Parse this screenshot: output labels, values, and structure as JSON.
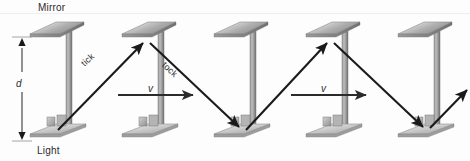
{
  "figure": {
    "title_alt": "Light clock moving at velocity v",
    "background_color": "#fdfdfd",
    "labels": {
      "mirror": "Mirror",
      "light": "Light",
      "distance": "d",
      "tick": "tick",
      "tock": "tock",
      "velocity_1": "v",
      "velocity_2": "v"
    },
    "colors": {
      "ink": "#2b2b2b",
      "beam": "#1a1a1a",
      "metal_light": "#e9e9e9",
      "metal_mid": "#b8b8b8",
      "metal_dark": "#8a8a8a",
      "post": "#a0a0a0",
      "post_dark": "#777777"
    },
    "clocks": [
      {
        "index": 1,
        "base_x": 55,
        "mirror_x": 53
      },
      {
        "index": 2,
        "base_x": 147,
        "mirror_x": 145
      },
      {
        "index": 3,
        "base_x": 239,
        "mirror_x": 237
      },
      {
        "index": 4,
        "base_x": 331,
        "mirror_x": 329
      },
      {
        "index": 5,
        "base_x": 423,
        "mirror_x": 421
      }
    ],
    "beam_path": {
      "points": [
        {
          "x": 58,
          "y": 129
        },
        {
          "x": 146,
          "y": 40
        },
        {
          "x": 242,
          "y": 129
        },
        {
          "x": 330,
          "y": 40
        },
        {
          "x": 426,
          "y": 129
        },
        {
          "x": 468,
          "y": 88
        }
      ],
      "segment_labels": [
        "tick",
        "tock",
        "tick",
        "tock",
        ""
      ]
    },
    "velocity_arrows": [
      {
        "x1": 118,
        "y1": 95,
        "x2": 196,
        "y2": 95,
        "label": "v"
      },
      {
        "x1": 291,
        "y1": 95,
        "x2": 369,
        "y2": 95,
        "label": "v"
      }
    ],
    "dimension": {
      "label": "d",
      "x": 22,
      "y_top": 40,
      "y_bottom": 138
    }
  }
}
